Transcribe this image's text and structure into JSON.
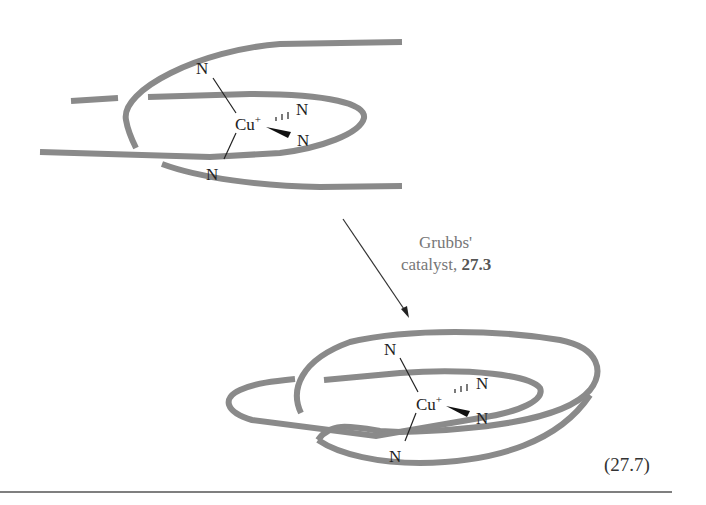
{
  "figure": {
    "top_complex": {
      "metal": "Cu",
      "charge": "+",
      "ligand_atoms": [
        "N",
        "N",
        "N",
        "N"
      ]
    },
    "reaction_arrow": {
      "condition_line1": "Grubbs'",
      "condition_line2_prefix": "catalyst, ",
      "condition_line2_ref": "27.3"
    },
    "bottom_complex": {
      "metal": "Cu",
      "charge": "+",
      "ligand_atoms": [
        "N",
        "N",
        "N",
        "N"
      ]
    },
    "equation_number": "(27.7)",
    "colors": {
      "strand": "#8a8a8a",
      "text": "#222222",
      "condition_text": "#777777",
      "rule": "#555555"
    }
  }
}
